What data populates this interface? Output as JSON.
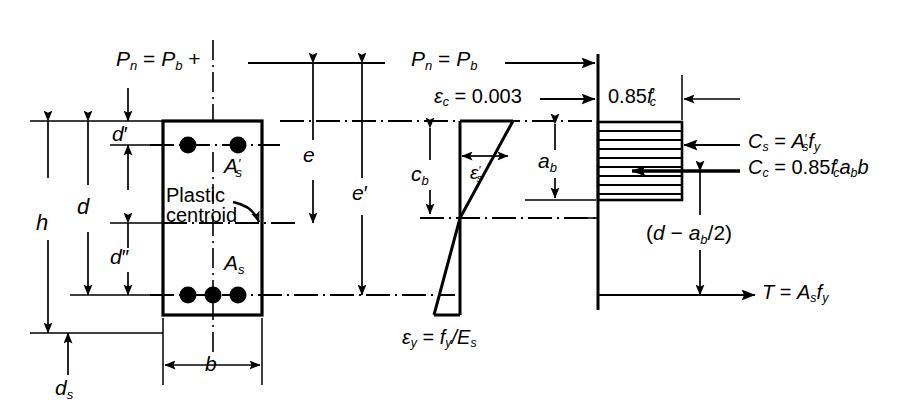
{
  "figure": {
    "type": "engineering-diagram",
    "panels": [
      "cross-section",
      "strain-diagram",
      "stress-block"
    ]
  },
  "section": {
    "top_load_label": "P_n = P_b +",
    "plastic_centroid_label_line1": "Plastic",
    "plastic_centroid_label_line2": "centroid",
    "compression_steel_label": "A'_s",
    "tension_steel_label": "A_s",
    "dim_h": "h",
    "dim_d": "d",
    "dim_d_prime": "d'",
    "dim_d_double_prime": "d\"",
    "dim_ds": "d_s",
    "dim_b": "b",
    "dim_e": "e",
    "dim_e_prime": "e'"
  },
  "strain": {
    "load_label": "P_n = P_b",
    "concrete_strain": "ϵ_c = 0.003",
    "steel_compression_strain": "ϵ'_s",
    "yield_strain": "ϵ_y = f_y/E_s",
    "neutral_axis_depth": "c_b",
    "stress_block_depth": "a_b"
  },
  "stress": {
    "concrete_stress": "0.85f'_c",
    "force_cs": "C_s = A'_s f_y",
    "force_cc": "C_c = 0.85f'_c a_b b",
    "lever_arm": "(d − a_b/2)",
    "force_t": "T = A_s f_y"
  },
  "style": {
    "line_color": "#000000",
    "background": "#ffffff"
  }
}
